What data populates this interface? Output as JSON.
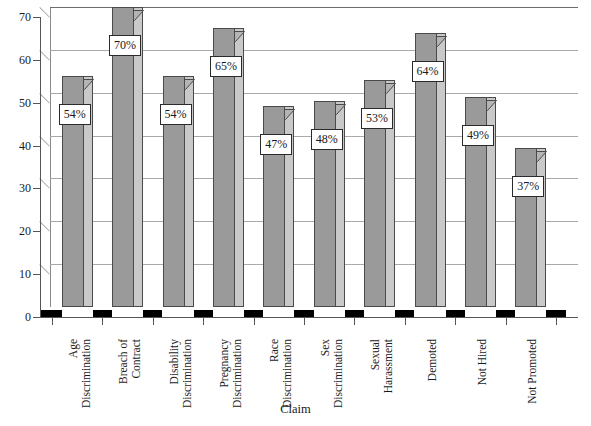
{
  "chart_data": {
    "type": "bar",
    "title": "",
    "xlabel": "Claim",
    "ylabel": "",
    "ylim": [
      0,
      70
    ],
    "ytick_step": 10,
    "grid": true,
    "legend": "none",
    "style": "3d-column",
    "categories": [
      "Age Discrimination",
      "Breach of Contract",
      "Disability Discrimination",
      "Pregnancy Discrimination",
      "Race Discrimination",
      "Sex Discrimination",
      "Sexual Harassment",
      "Demoted",
      "Not Hired",
      "Not Promoted"
    ],
    "category_lines": [
      [
        "Age",
        "Discrimination"
      ],
      [
        "Breach of",
        "Contract"
      ],
      [
        "Disability",
        "Discrimination"
      ],
      [
        "Pregnancy",
        "Discrimination"
      ],
      [
        "Race",
        "Discrimination"
      ],
      [
        "Sex",
        "Discrimination"
      ],
      [
        "Sexual",
        "Harassment"
      ],
      [
        "Demoted"
      ],
      [
        "Not Hired"
      ],
      [
        "Not Promoted"
      ]
    ],
    "values": [
      54,
      70,
      54,
      65,
      47,
      48,
      53,
      64,
      49,
      37
    ],
    "data_labels": [
      "54%",
      "70%",
      "54%",
      "65%",
      "47%",
      "48%",
      "53%",
      "64%",
      "49%",
      "37%"
    ],
    "ytick_labels": [
      "0",
      "10",
      "20",
      "30",
      "40",
      "50",
      "60",
      "70"
    ],
    "ytick_values": [
      0,
      10,
      20,
      30,
      40,
      50,
      60,
      70
    ],
    "colors": {
      "bar_front": "#9a9a9a",
      "bar_side": "#c9c9c9",
      "bar_top": "#b4b4b4",
      "bar_outline": "#4a4a4a",
      "gridline": "#a9a9a9",
      "axis": "#555555",
      "floor": "#000000",
      "label_box_background": "#ffffff",
      "label_box_border": "#2a2a2a",
      "text": "#1a1a1a",
      "background": "#ffffff"
    }
  }
}
